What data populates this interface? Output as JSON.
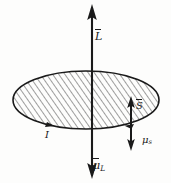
{
  "figure": {
    "background_color": "#fdfdfc",
    "ink_color": "#1a1a1a",
    "labels": {
      "angular_momentum": "L",
      "orbital_magnetic_moment": "μ",
      "orbital_magnetic_moment_subscript": "L",
      "spin": "S",
      "spin_magnetic_moment": "μ",
      "spin_magnetic_moment_subscript": "s",
      "current": "I"
    },
    "elements": {
      "disk": "hatched-ellipse",
      "axis_up_arrow": "angular-momentum-arrow",
      "axis_down_arrow": "orbital-moment-arrow",
      "side_up_arrow": "spin-arrow",
      "side_down_arrow": "spin-moment-arrow",
      "loop_arrowheads": "current-direction-arrowheads"
    }
  }
}
